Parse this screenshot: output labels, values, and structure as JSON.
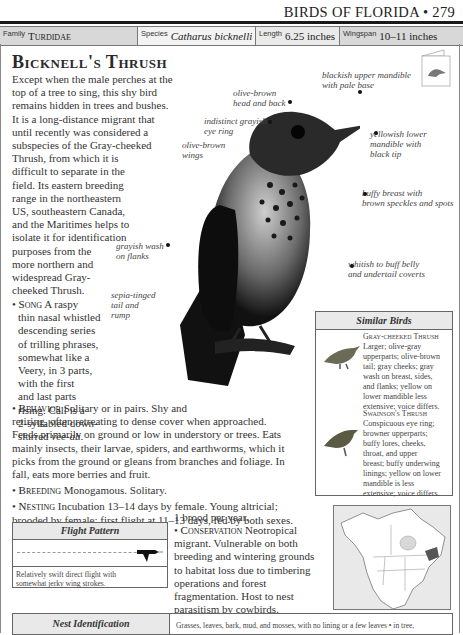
{
  "header": {
    "running_head": "BIRDS OF FLORIDA • 279"
  },
  "infobar": {
    "family_label": "Family",
    "family_value": "Turdidae",
    "species_label": "Species",
    "species_value": "Catharus bicknelli",
    "length_label": "Length",
    "length_value": "6.25 inches",
    "wingspan_label": "Wingspan",
    "wingspan_value": "10–11 inches"
  },
  "title": "Bicknell's Thrush",
  "intro": [
    "Except when the male perches at the",
    "top of a tree to sing, this shy bird",
    "remains hidden in trees and bushes.",
    "It is a long-distance migrant that",
    "until recently was considered a",
    "subspecies of the Gray-cheeked",
    "Thrush, from which it is",
    "difficult to separate in the",
    "field. Its eastern breeding",
    "range in the northeastern",
    "US, southeastern Canada,",
    "and the Maritimes helps to",
    "isolate it for identification",
    "purposes from the",
    "more northern and",
    "widespread Gray-",
    "cheeked Thrush."
  ],
  "song": {
    "label": "Song",
    "lines": [
      "A raspy",
      "thin nasal whistled",
      "descending series",
      "of trilling phrases,",
      "somewhat like a",
      "Veery, in 3 parts,",
      "with the first",
      "and last parts",
      "rising. Call is a",
      "2-syllabled down-"
    ],
    "last_prefix": "slurred ",
    "call": "vee-ah",
    "last_suffix": "."
  },
  "behavior": {
    "label": "Behavior",
    "first": "Solitary or in pairs. Shy and",
    "lines": [
      "retiring, often retreating to dense cover when approached.",
      "Feeds primarily on ground or low in understory or trees. Eats",
      "mainly insects, their larvae, spiders, and earthworms, which it",
      "picks from the ground or gleans from branches and foliage. In",
      "fall, eats more berries and fruit."
    ]
  },
  "breeding": {
    "label": "Breeding",
    "text": "Monogamous. Solitary."
  },
  "nesting": {
    "label": "Nesting",
    "line1": "Incubation 13–14 days by female. Young altricial;",
    "line2": "brooded by female; first flight at 11–13 days, fed by both sexes.",
    "line3": "1 brood per year."
  },
  "conservation": {
    "label": "Conservation",
    "lines": [
      "Neotropical",
      "migrant. Vulnerable on both",
      "breeding and wintering grounds",
      "to habitat loss due to timbering",
      "operations and forest",
      "fragmentation. Host to nest",
      "parasitism by cowbirds."
    ]
  },
  "callouts": {
    "upper_mandible": [
      "blackish upper mandible",
      "with pale base"
    ],
    "head_back": [
      "olive-brown",
      "head and back"
    ],
    "eye_ring": [
      "indistinct grayish",
      "eye ring"
    ],
    "wings": [
      "olive-brown",
      "wings"
    ],
    "lower_mandible": [
      "yellowish lower",
      "mandible with",
      "black tip"
    ],
    "breast": [
      "buffy breast with",
      "brown speckles and spots"
    ],
    "flanks": [
      "grayish wash",
      "on flanks"
    ],
    "belly": [
      "whitish to buff belly",
      "and undertail coverts"
    ],
    "tail": [
      "sepia-tinged",
      "tail and",
      "rump"
    ]
  },
  "similar_birds": {
    "heading": "Similar Birds",
    "items": [
      {
        "name": "Gray-cheeked Thrush",
        "lines": [
          "Larger; olive-gray",
          "upperparts; olive-brown",
          "tail; gray cheeks; gray",
          "wash on breast, sides,",
          "and flanks; yellow on",
          "lower mandible less",
          "extensive; voice differs."
        ]
      },
      {
        "name": "Swainson's Thrush",
        "lines": [
          "Conspicuous eye ring;",
          "browner upperparts;",
          "buffy lores, cheeks,",
          "throat, and upper",
          "breast; buffy underwing",
          "linings; yellow on lower",
          "mandible is less",
          "extensive; voice differs."
        ]
      }
    ]
  },
  "flight_pattern": {
    "heading": "Flight Pattern",
    "caption": [
      "Relatively swift direct flight with",
      "somewhat jerky wing strokes."
    ]
  },
  "nest_identification": {
    "heading": "Nest Identification",
    "text": "Grasses, leaves, bark, mud, and mosses, with no lining or a few leaves • in tree,"
  },
  "icons": {
    "bookmark": "bird-card-icon",
    "range_map": "north-america-map-icon"
  }
}
